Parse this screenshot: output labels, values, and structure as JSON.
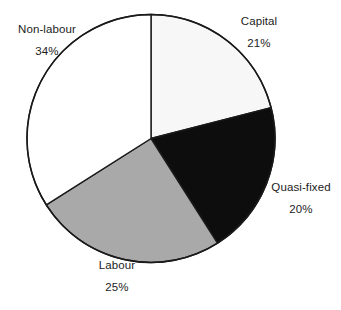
{
  "chart_data": {
    "type": "pie",
    "title": "",
    "xlabel": "",
    "ylabel": "",
    "start_angle_deg": 0,
    "direction": "clockwise",
    "grid": false,
    "legend": "none",
    "labels_position": "outside",
    "categories": [
      "Capital",
      "Quasi-fixed",
      "Labour",
      "Non-labour"
    ],
    "values": [
      21,
      20,
      25,
      34
    ],
    "value_suffix": "%",
    "slices": [
      {
        "label": "Capital",
        "value": 21,
        "value_text": "21%",
        "color": "#f7f7f7",
        "edge_color": "#1a1a1a"
      },
      {
        "label": "Quasi-fixed",
        "value": 20,
        "value_text": "20%",
        "color": "#0d0d0d",
        "edge_color": "#1a1a1a"
      },
      {
        "label": "Labour",
        "value": 25,
        "value_text": "25%",
        "color": "#a9a9a9",
        "edge_color": "#1a1a1a"
      },
      {
        "label": "Non-labour",
        "value": 34,
        "value_text": "34%",
        "color": "#ffffff",
        "edge_color": "#1a1a1a"
      }
    ]
  },
  "colors": {
    "background": "#ffffff",
    "outline": "#1a1a1a",
    "text": "#1c1c1c",
    "slice_white": "#ffffff",
    "slice_offwhite": "#f7f7f7",
    "slice_gray": "#a9a9a9",
    "slice_black": "#0d0d0d"
  }
}
